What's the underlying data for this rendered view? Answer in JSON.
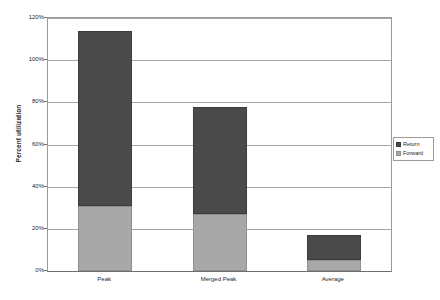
{
  "chart_data": {
    "type": "bar",
    "stacked": true,
    "title": "",
    "xlabel": "",
    "ylabel": "Percent utilization",
    "ylim": [
      0,
      120
    ],
    "ytick_values": [
      0,
      20,
      40,
      60,
      80,
      100,
      120
    ],
    "ytick_labels": [
      "0%",
      "20%",
      "40%",
      "60%",
      "80%",
      "100%",
      "120%"
    ],
    "grid": true,
    "legend_position": "right",
    "categories": [
      "Peak",
      "Merged Peak",
      "Average"
    ],
    "series": [
      {
        "name": "Forward",
        "color": "#a8a8a8",
        "values": [
          31,
          27,
          5
        ]
      },
      {
        "name": "Return",
        "color": "#4a4a4a",
        "values": [
          83,
          51,
          12
        ]
      }
    ],
    "totals": [
      114,
      78,
      17
    ]
  },
  "legend": {
    "items": [
      {
        "label": "Return",
        "color": "#4a4a4a"
      },
      {
        "label": "Forward",
        "color": "#a8a8a8"
      }
    ]
  },
  "colors": {
    "return": "#4a4a4a",
    "forward": "#a8a8a8",
    "gridline": "#a6a6a6",
    "axis": "#6e6e6e",
    "background": "#ffffff"
  }
}
